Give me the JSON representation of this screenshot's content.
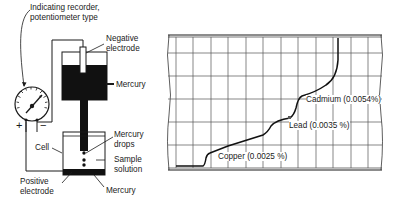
{
  "apparatus": {
    "recorder_label_line1": "Indicating recorder,",
    "recorder_label_line2": "potentiometer type",
    "negative_electrode_line1": "Negative",
    "negative_electrode_line2": "electrode",
    "mercury_top": "Mercury",
    "mercury_drops_line1": "Mercury",
    "mercury_drops_line2": "drops",
    "sample_solution_line1": "Sample",
    "sample_solution_line2": "solution",
    "cell": "Cell",
    "positive_electrode_line1": "Positive",
    "positive_electrode_line2": "electrode",
    "mercury_bottom": "Mercury",
    "plus_sign": "+",
    "minus_sign": "−"
  },
  "polarogram": {
    "copper_label": "Copper (0.0025 %)",
    "lead_label": "Lead (0.0035 %)",
    "cadmium_label": "Cadmium (0.0054%)",
    "grid_columns": 12,
    "grid_rows": 6
  },
  "colors": {
    "ink": "#1a1a1a",
    "grid": "#555555",
    "background": "#ffffff"
  }
}
